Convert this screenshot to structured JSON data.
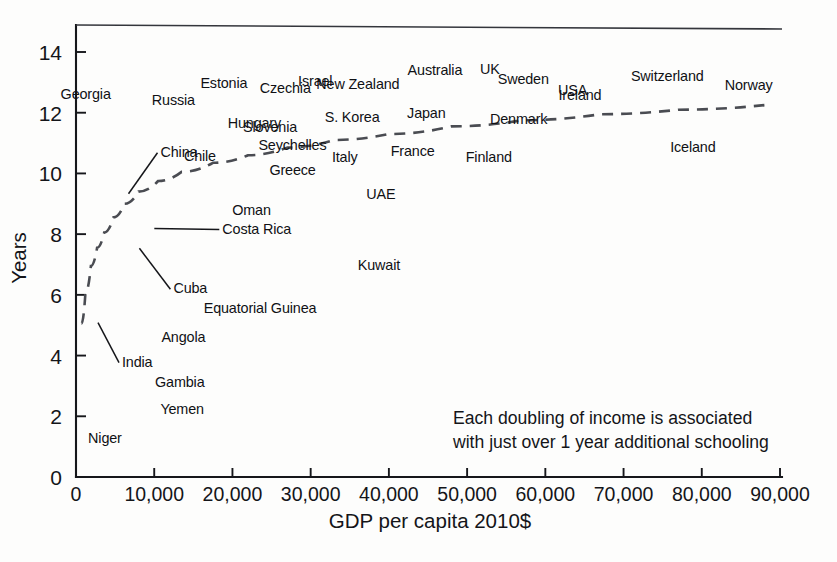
{
  "chart_data": {
    "type": "scatter",
    "title": "",
    "xlabel": "GDP per capita 2010$",
    "ylabel": "Years",
    "xlim": [
      0,
      90000
    ],
    "ylim": [
      0,
      15
    ],
    "grid": false,
    "legend": "none",
    "xticks": [
      "0",
      "10,000",
      "20,000",
      "30,000",
      "40,000",
      "50,000",
      "60,000",
      "70,000",
      "80,000",
      "90,000"
    ],
    "xtick_values": [
      0,
      10000,
      20000,
      30000,
      40000,
      50000,
      60000,
      70000,
      80000,
      90000
    ],
    "yticks": [
      "0",
      "2",
      "4",
      "6",
      "8",
      "10",
      "12",
      "14"
    ],
    "ytick_values": [
      0,
      2,
      4,
      6,
      8,
      10,
      12,
      14
    ],
    "annotation": {
      "line1": "Each doubling of income is associated",
      "line2": "with just over 1 year additional schooling"
    },
    "trendline": {
      "style": "dashed",
      "description": "logarithmic fit: schooling rises about 1 year per doubling of GDP per capita",
      "points": [
        [
          700,
          5.05
        ],
        [
          1200,
          6.05
        ],
        [
          1900,
          6.95
        ],
        [
          2700,
          7.55
        ],
        [
          3600,
          8.05
        ],
        [
          4800,
          8.55
        ],
        [
          6200,
          9.0
        ],
        [
          8000,
          9.4
        ],
        [
          10500,
          9.75
        ],
        [
          13500,
          10.05
        ],
        [
          17500,
          10.35
        ],
        [
          22000,
          10.6
        ],
        [
          27000,
          10.85
        ],
        [
          33000,
          11.1
        ],
        [
          40000,
          11.3
        ],
        [
          48000,
          11.55
        ],
        [
          57000,
          11.75
        ],
        [
          67000,
          11.95
        ],
        [
          77000,
          12.1
        ],
        [
          88000,
          12.25
        ]
      ]
    },
    "labeled_points": [
      {
        "name": "Georgia",
        "x": 3400,
        "y": 12.05,
        "label_dx": -42,
        "label_dy": -12,
        "anchor": "start"
      },
      {
        "name": "Russia",
        "x": 14800,
        "y": 11.9,
        "label_dx": -40,
        "label_dy": -11,
        "anchor": "start"
      },
      {
        "name": "Estonia",
        "x": 20000,
        "y": 12.4,
        "label_dx": -32,
        "label_dy": -13,
        "anchor": "start"
      },
      {
        "name": "Czechia",
        "x": 25800,
        "y": 12.25,
        "label_dx": -18,
        "label_dy": -12,
        "anchor": "start"
      },
      {
        "name": "Israel",
        "x": 31200,
        "y": 12.45,
        "label_dx": -22,
        "label_dy": -13,
        "anchor": "start"
      },
      {
        "name": "New Zealand",
        "x": 36600,
        "y": 12.4,
        "label_dx": -46,
        "label_dy": -12,
        "anchor": "start"
      },
      {
        "name": "Australia",
        "x": 47500,
        "y": 12.8,
        "label_dx": -40,
        "label_dy": -13,
        "anchor": "start"
      },
      {
        "name": "UK",
        "x": 53200,
        "y": 12.85,
        "label_dx": -12,
        "label_dy": -13,
        "anchor": "start"
      },
      {
        "name": "Sweden",
        "x": 58000,
        "y": 12.55,
        "label_dx": -32,
        "label_dy": -12,
        "anchor": "start"
      },
      {
        "name": "USA",
        "x": 60600,
        "y": 12.35,
        "label_dx": 8,
        "label_dy": -7,
        "anchor": "start"
      },
      {
        "name": "Switzerland",
        "x": 75800,
        "y": 12.65,
        "label_dx": -38,
        "label_dy": -12,
        "anchor": "start"
      },
      {
        "name": "Norway",
        "x": 86000,
        "y": 12.35,
        "label_dx": -24,
        "label_dy": -12,
        "anchor": "start"
      },
      {
        "name": "Denmark",
        "x": 56500,
        "y": 12.1,
        "label_dx": -28,
        "label_dy": 14,
        "anchor": "start"
      },
      {
        "name": "Ireland",
        "x": 64500,
        "y": 12.05,
        "label_dx": -22,
        "label_dy": -11,
        "anchor": "start"
      },
      {
        "name": "Hungary",
        "x": 18500,
        "y": 11.65,
        "label_dx": 7,
        "label_dy": 5,
        "anchor": "start"
      },
      {
        "name": "Slovenia",
        "x": 25200,
        "y": 11.8,
        "label_dx": -30,
        "label_dy": 13,
        "anchor": "start"
      },
      {
        "name": "S. Korea",
        "x": 30900,
        "y": 11.85,
        "label_dx": 7,
        "label_dy": 5,
        "anchor": "start"
      },
      {
        "name": "Japan",
        "x": 45400,
        "y": 11.5,
        "label_dx": -24,
        "label_dy": -10,
        "anchor": "start"
      },
      {
        "name": "Seychelles",
        "x": 22300,
        "y": 10.9,
        "label_dx": 8,
        "label_dy": 4,
        "anchor": "start"
      },
      {
        "name": "France",
        "x": 43300,
        "y": 11.05,
        "label_dx": -24,
        "label_dy": 14,
        "anchor": "start"
      },
      {
        "name": "Finland",
        "x": 48800,
        "y": 10.55,
        "label_dx": 8,
        "label_dy": 5,
        "anchor": "start"
      },
      {
        "name": "Iceland",
        "x": 75200,
        "y": 10.4,
        "label_dx": 6,
        "label_dy": -9,
        "anchor": "start"
      },
      {
        "name": "China",
        "x": 6200,
        "y": 9.3,
        "label_dx": 36,
        "label_dy": -38,
        "anchor": "start",
        "leader": true
      },
      {
        "name": "Chile",
        "x": 14300,
        "y": 10.15,
        "label_dx": -4,
        "label_dy": -8,
        "anchor": "start"
      },
      {
        "name": "Greece",
        "x": 23700,
        "y": 10.2,
        "label_dx": 8,
        "label_dy": 8,
        "anchor": "start"
      },
      {
        "name": "Italy",
        "x": 34500,
        "y": 10.0,
        "label_dx": -14,
        "label_dy": -11,
        "anchor": "start"
      },
      {
        "name": "UAE",
        "x": 36200,
        "y": 9.35,
        "label_dx": 7,
        "label_dy": 6,
        "anchor": "start"
      },
      {
        "name": "Oman",
        "x": 19200,
        "y": 8.4,
        "label_dx": 6,
        "label_dy": -7,
        "anchor": "start"
      },
      {
        "name": "Costa Rica",
        "x": 9500,
        "y": 8.15,
        "label_dx": 72,
        "label_dy": 4,
        "anchor": "start",
        "leader": true
      },
      {
        "name": "Cuba",
        "x": 7600,
        "y": 7.5,
        "label_dx": 38,
        "label_dy": 44,
        "anchor": "start",
        "leader": true
      },
      {
        "name": "Kuwait",
        "x": 35000,
        "y": 7.0,
        "label_dx": 8,
        "label_dy": 5,
        "anchor": "start"
      },
      {
        "name": "Equatorial Guinea",
        "x": 15300,
        "y": 5.45,
        "label_dx": 8,
        "label_dy": 1,
        "anchor": "start"
      },
      {
        "name": "Angola",
        "x": 9900,
        "y": 4.6,
        "label_dx": 8,
        "label_dy": 5,
        "anchor": "start"
      },
      {
        "name": "India",
        "x": 2300,
        "y": 5.05,
        "label_dx": 28,
        "label_dy": 43,
        "anchor": "start",
        "leader": true
      },
      {
        "name": "Gambia",
        "x": 9200,
        "y": 2.75,
        "label_dx": 7,
        "label_dy": -7,
        "anchor": "start"
      },
      {
        "name": "Yemen",
        "x": 9900,
        "y": 2.5,
        "label_dx": 7,
        "label_dy": 13,
        "anchor": "start"
      },
      {
        "name": "Niger",
        "x": 650,
        "y": 1.4,
        "label_dx": 7,
        "label_dy": 8,
        "anchor": "start"
      }
    ],
    "unlabeled_points": [
      [
        400,
        10.35
      ],
      [
        500,
        10.45
      ],
      [
        900,
        11.15
      ],
      [
        1400,
        11.2
      ],
      [
        2100,
        11.25
      ],
      [
        1100,
        10.75
      ],
      [
        2300,
        10.85
      ],
      [
        3100,
        11.45
      ],
      [
        4200,
        11.3
      ],
      [
        5300,
        11.55
      ],
      [
        500,
        10.2
      ],
      [
        1500,
        10.05
      ],
      [
        2500,
        10.4
      ],
      [
        3300,
        10.25
      ],
      [
        4500,
        10.55
      ],
      [
        600,
        9.55
      ],
      [
        1700,
        9.85
      ],
      [
        2900,
        9.7
      ],
      [
        4000,
        9.95
      ],
      [
        5100,
        9.4
      ],
      [
        900,
        9.25
      ],
      [
        2000,
        9.15
      ],
      [
        3600,
        9.35
      ],
      [
        4900,
        9.1
      ],
      [
        6400,
        9.2
      ],
      [
        700,
        8.75
      ],
      [
        1800,
        8.85
      ],
      [
        3000,
        8.6
      ],
      [
        4300,
        8.95
      ],
      [
        5700,
        8.7
      ],
      [
        1000,
        8.35
      ],
      [
        2200,
        8.25
      ],
      [
        3400,
        8.45
      ],
      [
        4600,
        8.3
      ],
      [
        6100,
        8.5
      ],
      [
        800,
        8.05
      ],
      [
        1900,
        8.15
      ],
      [
        3200,
        7.95
      ],
      [
        4800,
        8.1
      ],
      [
        6800,
        8.2
      ],
      [
        600,
        7.65
      ],
      [
        1600,
        7.75
      ],
      [
        2700,
        7.55
      ],
      [
        3900,
        7.7
      ],
      [
        5400,
        7.45
      ],
      [
        400,
        7.15
      ],
      [
        1300,
        7.25
      ],
      [
        2400,
        7.05
      ],
      [
        3700,
        7.35
      ],
      [
        5900,
        7.6
      ],
      [
        300,
        6.75
      ],
      [
        1100,
        6.85
      ],
      [
        2100,
        6.55
      ],
      [
        3500,
        6.65
      ],
      [
        5600,
        6.45
      ],
      [
        250,
        6.25
      ],
      [
        900,
        6.35
      ],
      [
        1800,
        6.15
      ],
      [
        3100,
        6.05
      ],
      [
        6600,
        5.85
      ],
      [
        200,
        5.95
      ],
      [
        700,
        5.75
      ],
      [
        1500,
        5.65
      ],
      [
        2600,
        5.55
      ],
      [
        4400,
        5.3
      ],
      [
        150,
        5.45
      ],
      [
        600,
        5.35
      ],
      [
        1300,
        5.15
      ],
      [
        2200,
        5.05
      ],
      [
        3000,
        5.25
      ],
      [
        200,
        4.85
      ],
      [
        800,
        4.75
      ],
      [
        1700,
        4.95
      ],
      [
        2400,
        4.65
      ],
      [
        3400,
        4.55
      ],
      [
        150,
        4.45
      ],
      [
        500,
        4.35
      ],
      [
        1200,
        4.25
      ],
      [
        2000,
        4.45
      ],
      [
        2800,
        4.15
      ],
      [
        180,
        4.05
      ],
      [
        700,
        3.95
      ],
      [
        1500,
        3.85
      ],
      [
        2300,
        4.05
      ],
      [
        300,
        3.75
      ],
      [
        250,
        3.15
      ],
      [
        900,
        3.05
      ],
      [
        1800,
        3.1
      ],
      [
        2600,
        2.95
      ],
      [
        400,
        3.25
      ],
      [
        200,
        2.75
      ],
      [
        700,
        2.65
      ],
      [
        1400,
        2.85
      ],
      [
        350,
        2.45
      ],
      [
        1100,
        2.35
      ],
      [
        180,
        2.15
      ],
      [
        600,
        2.05
      ],
      [
        1200,
        2.25
      ],
      [
        300,
        1.85
      ],
      [
        850,
        1.75
      ],
      [
        220,
        1.55
      ],
      [
        500,
        1.45
      ],
      [
        160,
        1.35
      ],
      [
        7800,
        11.45
      ],
      [
        10200,
        11.15
      ],
      [
        11500,
        10.85
      ],
      [
        9100,
        10.4
      ],
      [
        12800,
        10.2
      ],
      [
        8500,
        9.65
      ],
      [
        11200,
        9.25
      ],
      [
        13600,
        8.75
      ],
      [
        16500,
        9.1
      ],
      [
        18000,
        8.35
      ],
      [
        20500,
        8.6
      ],
      [
        21800,
        8.05
      ],
      [
        24500,
        8.85
      ],
      [
        26500,
        9.35
      ],
      [
        28500,
        8.7
      ],
      [
        30500,
        9.55
      ],
      [
        33000,
        8.95
      ],
      [
        38500,
        9.45
      ],
      [
        41000,
        8.65
      ],
      [
        43000,
        10.5
      ],
      [
        46500,
        11.05
      ],
      [
        47800,
        10.75
      ],
      [
        49500,
        11.95
      ],
      [
        50500,
        11.25
      ],
      [
        51800,
        10.6
      ],
      [
        54000,
        12.35
      ],
      [
        55500,
        11.6
      ],
      [
        59500,
        10.95
      ],
      [
        62500,
        11.45
      ],
      [
        45000,
        12.15
      ],
      [
        42500,
        11.85
      ],
      [
        39000,
        10.15
      ],
      [
        16800,
        10.75
      ],
      [
        14500,
        11.05
      ],
      [
        7200,
        12.15
      ],
      [
        5800,
        10.95
      ],
      [
        6900,
        7.85
      ],
      [
        8200,
        7.45
      ],
      [
        9800,
        7.75
      ],
      [
        12200,
        7.25
      ],
      [
        5200,
        6.95
      ],
      [
        7400,
        6.35
      ],
      [
        4100,
        6.25
      ],
      [
        3700,
        5.85
      ],
      [
        10800,
        8.45
      ],
      [
        12500,
        8.25
      ],
      [
        15800,
        8.15
      ],
      [
        17200,
        7.95
      ]
    ]
  },
  "axes": {
    "x_title": "GDP per capita 2010$",
    "y_title": "Years"
  }
}
